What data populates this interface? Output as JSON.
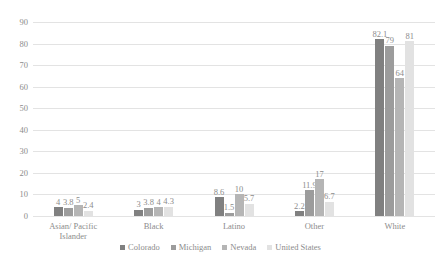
{
  "chart_data": {
    "type": "bar",
    "title": "",
    "xlabel": "",
    "ylabel": "",
    "ylim": [
      0,
      90
    ],
    "ystep": 10,
    "grid": true,
    "legend_position": "bottom",
    "yticks": [
      "90",
      "80",
      "70",
      "60",
      "50",
      "40",
      "30",
      "20",
      "10",
      "0"
    ],
    "categories": [
      "Asian/ Pacific Islander",
      "Black",
      "Latino",
      "Other",
      "White"
    ],
    "series": [
      {
        "name": "Colorado",
        "color": "#808080",
        "values": [
          4,
          3,
          8.6,
          2.2,
          82.1
        ],
        "labels": [
          "4",
          "3",
          "8.6",
          "2.2",
          "82.1"
        ]
      },
      {
        "name": "Michigan",
        "color": "#9c9c9c",
        "values": [
          3.8,
          3.8,
          1.5,
          11.9,
          79
        ],
        "labels": [
          "3.8",
          "3.8",
          "1.5",
          "11.9",
          "79"
        ]
      },
      {
        "name": "Nevada",
        "color": "#b5b5b5",
        "values": [
          5,
          4,
          10,
          17,
          64
        ],
        "labels": [
          "5",
          "4",
          "10",
          "17",
          "64"
        ]
      },
      {
        "name": "United States",
        "color": "#e2e2e2",
        "values": [
          2.4,
          4.3,
          5.7,
          6.7,
          81
        ],
        "labels": [
          "2.4",
          "4.3",
          "5.7",
          "6.7",
          "81"
        ]
      }
    ]
  }
}
